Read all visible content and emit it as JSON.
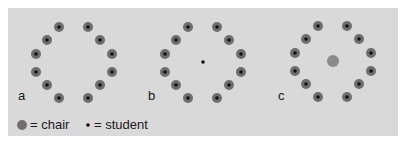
{
  "colors": {
    "panel_bg": "#d9d9d9",
    "chair_outer": "#6e6e6e",
    "chair_inner": "#8a8a8a",
    "student": "#111111"
  },
  "arrangements": [
    {
      "label": "a",
      "chairs_in_circle": 12,
      "students_in_circle": 12,
      "center": "empty"
    },
    {
      "label": "b",
      "chairs_in_circle": 12,
      "students_in_circle": 12,
      "center": "student"
    },
    {
      "label": "c",
      "chairs_in_circle": 12,
      "students_in_circle": 12,
      "center": "chair"
    }
  ],
  "legend": {
    "chair_label": "= chair",
    "student_label": "= student"
  }
}
